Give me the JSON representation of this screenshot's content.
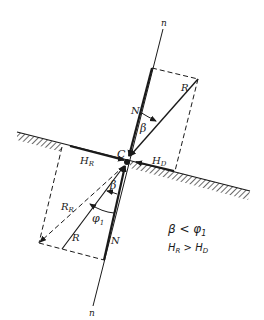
{
  "figure": {
    "colors": {
      "ink": "#1a1a1a",
      "background": "#ffffff"
    }
  },
  "labels": {
    "normal_top": "n",
    "normal_bottom": "n",
    "point": "C",
    "N_upper": "N",
    "R_upper": "R",
    "beta_upper": "β",
    "H_R": "H",
    "H_R_sub": "R",
    "H_D": "H",
    "H_D_sub": "D",
    "beta_lower": "β",
    "R_R": "R",
    "R_R_sub": "R",
    "phi": "φ",
    "phi_sub": "1",
    "R_lower": "R",
    "N_lower": "N"
  },
  "conditions": {
    "line1_a": "β < φ",
    "line1_sub": "1",
    "line2_a": "H",
    "line2_a_sub": "R",
    "line2_op": " > H",
    "line2_b_sub": "D"
  }
}
